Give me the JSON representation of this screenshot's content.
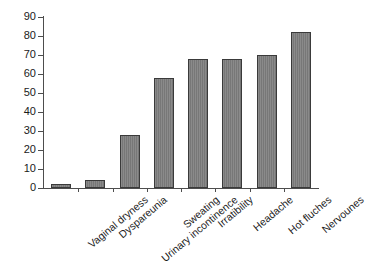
{
  "chart_data": {
    "type": "bar",
    "title": "",
    "subtitle": "",
    "xlabel": "",
    "ylabel": "",
    "categories": [
      "Vaginal dryness",
      "Dyspareunia",
      "Urinary incontinence",
      "Sweating",
      "Irratibility",
      "Headache",
      "Hot fluches",
      "Nervounes"
    ],
    "values": [
      2,
      4,
      28,
      58,
      68,
      68,
      70,
      82
    ],
    "ylim": [
      0,
      90
    ],
    "ytick_labels": [
      "90",
      "80",
      "70",
      "60",
      "50",
      "40",
      "30",
      "20",
      "10",
      "0"
    ],
    "ytick_values": [
      90,
      80,
      70,
      60,
      50,
      40,
      30,
      20,
      10,
      0
    ],
    "ytick_step": 10,
    "grid": false,
    "legend": false,
    "legend_position": "none",
    "bar_color": "#7d7d7d",
    "bar_edge_color": "#3a3a3a",
    "axis_color": "#4d4d4d",
    "background_color": "#ffffff",
    "xlabel_rotation_degrees": -40
  }
}
